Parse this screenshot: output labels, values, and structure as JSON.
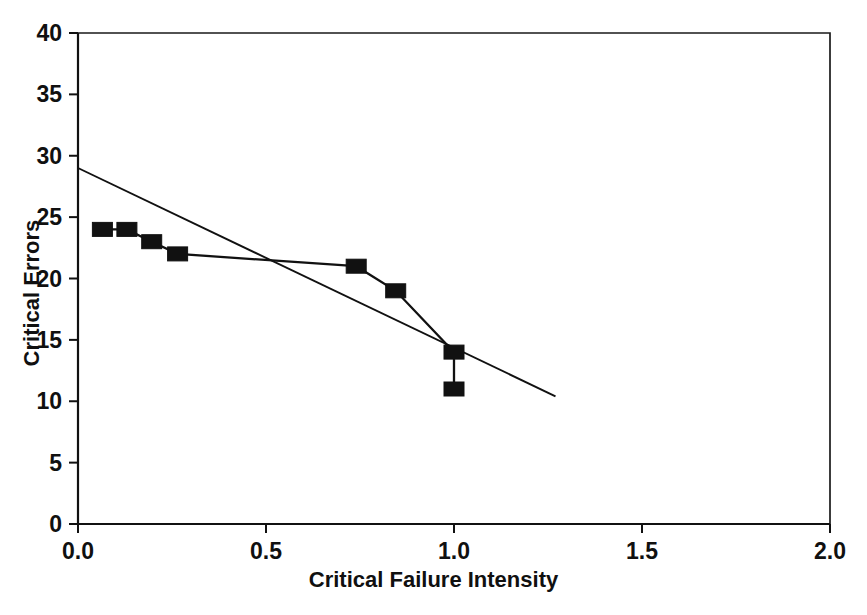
{
  "chart_data": {
    "type": "scatter",
    "title": "",
    "subtitle": "",
    "xlabel": "Critical Failure Intensity",
    "ylabel": "Critical Errors",
    "xlim": [
      0.0,
      2.0
    ],
    "ylim": [
      0,
      40
    ],
    "xticks": [
      "0.0",
      "0.5",
      "1.0",
      "1.5",
      "2.0"
    ],
    "xtick_values": [
      0.0,
      0.5,
      1.0,
      1.5,
      2.0
    ],
    "yticks": [
      "0",
      "5",
      "10",
      "15",
      "20",
      "25",
      "30",
      "35",
      "40"
    ],
    "ytick_values": [
      0,
      5,
      10,
      15,
      20,
      25,
      30,
      35,
      40
    ],
    "grid": false,
    "legend": null,
    "marker_style": "filled-square",
    "marker_color": "#111111",
    "line_color": "#111111",
    "series": [
      {
        "name": "Critical errors vs critical failure intensity",
        "type": "scatter-with-connecting-line",
        "points": [
          {
            "x": 0.065,
            "y": 24
          },
          {
            "x": 0.13,
            "y": 24
          },
          {
            "x": 0.196,
            "y": 23
          },
          {
            "x": 0.265,
            "y": 22
          },
          {
            "x": 0.74,
            "y": 21
          },
          {
            "x": 0.845,
            "y": 19
          },
          {
            "x": 1.0,
            "y": 14
          },
          {
            "x": 1.0,
            "y": 11
          }
        ]
      },
      {
        "name": "Linear regression trend",
        "type": "line",
        "points": [
          {
            "x": 0.0,
            "y": 29.0
          },
          {
            "x": 1.27,
            "y": 10.4
          }
        ]
      }
    ]
  },
  "axes": {
    "plot_left_px": 78,
    "plot_right_px": 830,
    "plot_top_px": 33,
    "plot_bottom_px": 524
  },
  "colors": {
    "background": "#ffffff",
    "ink": "#111111",
    "frame": "#1a1a1a"
  }
}
